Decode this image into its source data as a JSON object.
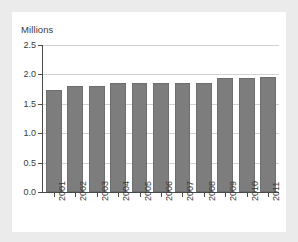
{
  "chart_data": {
    "type": "bar",
    "title": "",
    "subtitle": "",
    "ylabel": "Millions",
    "xlabel": "",
    "categories": [
      "2001",
      "2002",
      "2003",
      "2004",
      "2005",
      "2006",
      "2007",
      "2008",
      "2009",
      "2010",
      "2011"
    ],
    "values": [
      1.74,
      1.8,
      1.8,
      1.85,
      1.86,
      1.85,
      1.85,
      1.86,
      1.94,
      1.94,
      1.95
    ],
    "series": [
      {
        "name": "Millions",
        "values": [
          1.74,
          1.8,
          1.8,
          1.85,
          1.86,
          1.85,
          1.85,
          1.86,
          1.94,
          1.94,
          1.95
        ]
      }
    ],
    "ylim": [
      0.0,
      2.5
    ],
    "ytick_labels": [
      "0.0",
      "0.5",
      "1.0",
      "1.5",
      "2.0",
      "2.5"
    ],
    "ytick_values": [
      0.0,
      0.5,
      1.0,
      1.5,
      2.0,
      2.5
    ],
    "xtick_labels": [
      "2001",
      "2002",
      "2003",
      "2004",
      "2005",
      "2006",
      "2007",
      "2008",
      "2009",
      "2010",
      "2011"
    ],
    "grid": true,
    "grid_axis": "y",
    "legend": false,
    "legend_position": "none",
    "xtick_rotation": 90,
    "colors": {
      "bar_fill": "#7d7d7d",
      "bar_edge": "#6e6e6e",
      "grid": "#d2d2d2",
      "axis": "#4a4a4a",
      "text": "#3a3a3a",
      "panel_background": "#ffffff",
      "figure_background": "#ebebeb"
    }
  },
  "axis": {
    "y_title": "Millions"
  }
}
